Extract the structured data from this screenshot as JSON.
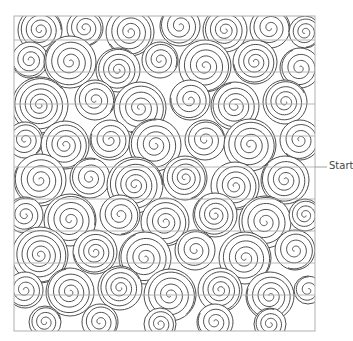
{
  "diagram": {
    "type": "quilting-pattern",
    "motif": "spiral swirls",
    "start_label": "Start",
    "frame": {
      "x": 14,
      "y": 16,
      "width": 301,
      "height": 315
    },
    "row_lines_y": [
      40,
      72,
      104,
      136,
      167,
      199,
      231,
      263,
      295
    ],
    "start_y": 167,
    "colors": {
      "stroke": "#3a3a3a",
      "grid": "#b0b0b0",
      "background": "#ffffff"
    },
    "spirals": [
      [
        40,
        30,
        22
      ],
      [
        85,
        28,
        18
      ],
      [
        130,
        32,
        24
      ],
      [
        180,
        26,
        20
      ],
      [
        225,
        30,
        22
      ],
      [
        270,
        28,
        20
      ],
      [
        305,
        32,
        16
      ],
      [
        30,
        60,
        18
      ],
      [
        70,
        62,
        26
      ],
      [
        118,
        70,
        22
      ],
      [
        160,
        60,
        18
      ],
      [
        205,
        66,
        26
      ],
      [
        255,
        62,
        22
      ],
      [
        300,
        68,
        20
      ],
      [
        40,
        105,
        28
      ],
      [
        95,
        100,
        20
      ],
      [
        140,
        108,
        26
      ],
      [
        190,
        100,
        20
      ],
      [
        235,
        106,
        24
      ],
      [
        285,
        102,
        22
      ],
      [
        25,
        140,
        18
      ],
      [
        65,
        145,
        24
      ],
      [
        110,
        140,
        20
      ],
      [
        155,
        145,
        26
      ],
      [
        205,
        140,
        20
      ],
      [
        250,
        145,
        26
      ],
      [
        300,
        140,
        20
      ],
      [
        40,
        180,
        26
      ],
      [
        90,
        178,
        20
      ],
      [
        135,
        185,
        28
      ],
      [
        185,
        178,
        22
      ],
      [
        235,
        186,
        24
      ],
      [
        285,
        180,
        24
      ],
      [
        25,
        215,
        18
      ],
      [
        70,
        220,
        26
      ],
      [
        120,
        215,
        20
      ],
      [
        165,
        222,
        24
      ],
      [
        215,
        215,
        22
      ],
      [
        265,
        222,
        26
      ],
      [
        305,
        215,
        16
      ],
      [
        40,
        255,
        28
      ],
      [
        95,
        252,
        22
      ],
      [
        145,
        258,
        26
      ],
      [
        195,
        250,
        20
      ],
      [
        245,
        258,
        26
      ],
      [
        295,
        250,
        20
      ],
      [
        25,
        290,
        18
      ],
      [
        70,
        292,
        24
      ],
      [
        120,
        288,
        22
      ],
      [
        170,
        295,
        26
      ],
      [
        220,
        290,
        22
      ],
      [
        270,
        296,
        24
      ],
      [
        308,
        290,
        14
      ],
      [
        45,
        322,
        16
      ],
      [
        100,
        322,
        18
      ],
      [
        160,
        324,
        16
      ],
      [
        215,
        322,
        18
      ],
      [
        270,
        324,
        16
      ]
    ]
  }
}
